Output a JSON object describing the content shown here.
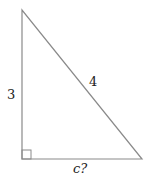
{
  "diagram": {
    "type": "right-triangle",
    "stroke_color": "#8a8a8a",
    "vertices": {
      "top": [
        22,
        10
      ],
      "right_angle": [
        22,
        159
      ],
      "bottom_right": [
        142,
        159
      ]
    },
    "right_angle_marker_size": 9,
    "labels": {
      "left_side": "3",
      "hypotenuse": "4",
      "bottom_side": "c?"
    }
  }
}
